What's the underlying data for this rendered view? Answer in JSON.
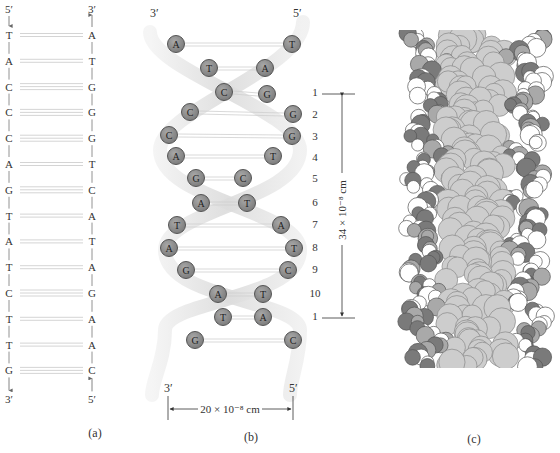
{
  "panel_a": {
    "caption": "(a)",
    "left_strand": {
      "top_label": "5′",
      "bottom_label": "3′",
      "bases": [
        "T",
        "A",
        "C",
        "C",
        "C",
        "A",
        "G",
        "T",
        "A",
        "T",
        "C",
        "T",
        "T",
        "G"
      ]
    },
    "right_strand": {
      "top_label": "3′",
      "bottom_label": "5′",
      "bases": [
        "A",
        "T",
        "G",
        "G",
        "G",
        "T",
        "C",
        "A",
        "T",
        "A",
        "G",
        "A",
        "A",
        "C"
      ]
    },
    "hydrogen_bonds": [
      2,
      2,
      3,
      3,
      3,
      2,
      3,
      2,
      2,
      2,
      3,
      2,
      2,
      3
    ]
  },
  "panel_b": {
    "caption": "(b)",
    "top_left_label": "3′",
    "top_right_label": "5′",
    "bottom_left_label": "3′",
    "bottom_right_label": "5′",
    "pairs": [
      {
        "left": "A",
        "right": "T"
      },
      {
        "left": "T",
        "right": "A"
      },
      {
        "left": "C",
        "right": "G"
      },
      {
        "left": "C",
        "right": "G"
      },
      {
        "left": "C",
        "right": "G"
      },
      {
        "left": "A",
        "right": "T"
      },
      {
        "left": "G",
        "right": "C"
      },
      {
        "left": "A",
        "right": "T"
      },
      {
        "left": "T",
        "right": "A"
      },
      {
        "left": "A",
        "right": "T"
      },
      {
        "left": "G",
        "right": "C"
      },
      {
        "left": "A",
        "right": "T"
      },
      {
        "left": "T",
        "right": "A"
      },
      {
        "left": "G",
        "right": "C"
      }
    ],
    "turn_numbers": [
      "1",
      "2",
      "3",
      "4",
      "5",
      "6",
      "7",
      "8",
      "9",
      "10",
      "1"
    ],
    "pitch_label": "34 × 10⁻⁸ cm",
    "width_label": "20 × 10⁻⁸ cm"
  },
  "panel_c": {
    "caption": "(c)"
  },
  "colors": {
    "nucleotide_fill": "#8a8a8a",
    "nucleotide_stroke": "#555555",
    "ribbon": "#e2e2e2",
    "bond_line": "#c8c8c8",
    "text": "#333333"
  }
}
